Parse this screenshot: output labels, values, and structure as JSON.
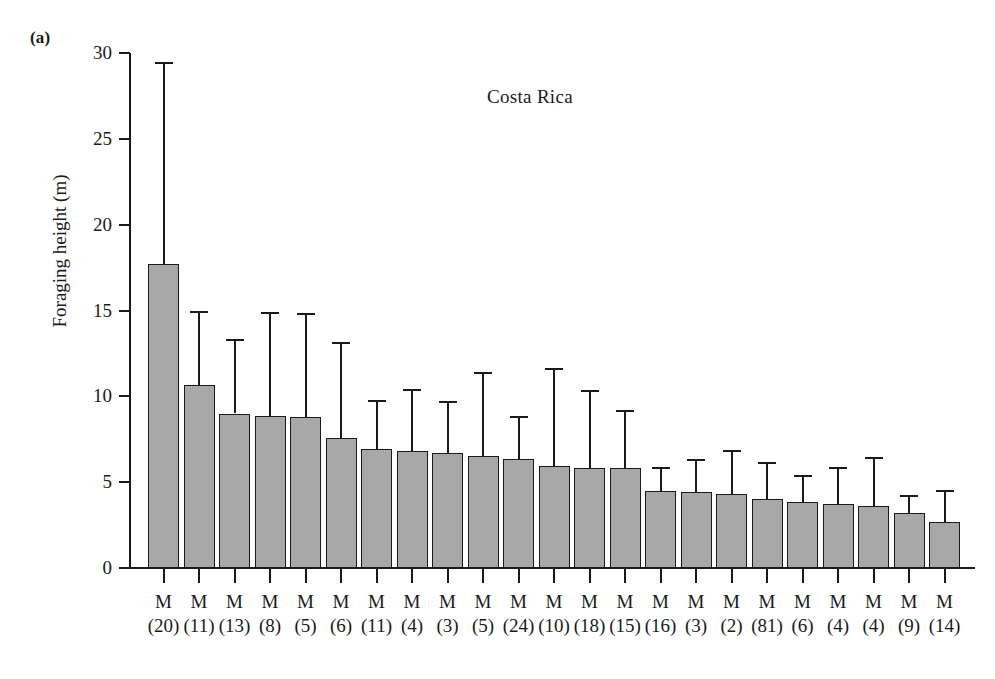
{
  "panel": {
    "label": "(a)"
  },
  "axes": {
    "ylabel": "Foraging height (m)",
    "yticks": [
      "0",
      "5",
      "10",
      "15",
      "20",
      "25",
      "30"
    ],
    "ytick_values": [
      0,
      5,
      10,
      15,
      20,
      25,
      30
    ]
  },
  "chart_data": {
    "type": "bar",
    "title": "Costa Rica",
    "xlabel": "",
    "ylabel": "Foraging height (m)",
    "ylim": [
      0,
      30
    ],
    "grid": false,
    "legend": null,
    "error_bars": "upper only (mean + SD)",
    "categories": [
      "M (20)",
      "M (11)",
      "M (13)",
      "M (8)",
      "M (5)",
      "M (6)",
      "M (11)",
      "M (4)",
      "M (3)",
      "M (5)",
      "M (24)",
      "M (10)",
      "M (18)",
      "M (15)",
      "M (16)",
      "M (3)",
      "M (2)",
      "M (81)",
      "M (6)",
      "M (4)",
      "M (4)",
      "M (9)",
      "M (14)"
    ],
    "sex_labels": [
      "M",
      "M",
      "M",
      "M",
      "M",
      "M",
      "M",
      "M",
      "M",
      "M",
      "M",
      "M",
      "M",
      "M",
      "M",
      "M",
      "M",
      "M",
      "M",
      "M",
      "M",
      "M",
      "M"
    ],
    "sample_sizes": [
      "(20)",
      "(11)",
      "(13)",
      "(8)",
      "(5)",
      "(6)",
      "(11)",
      "(4)",
      "(3)",
      "(5)",
      "(24)",
      "(10)",
      "(18)",
      "(15)",
      "(16)",
      "(3)",
      "(2)",
      "(81)",
      "(6)",
      "(4)",
      "(4)",
      "(9)",
      "(14)"
    ],
    "sample_size_values": [
      20,
      11,
      13,
      8,
      5,
      6,
      11,
      4,
      3,
      5,
      24,
      10,
      18,
      15,
      16,
      3,
      2,
      81,
      6,
      4,
      4,
      9,
      14
    ],
    "values": [
      17.7,
      10.65,
      9.0,
      8.85,
      8.8,
      7.6,
      6.95,
      6.8,
      6.7,
      6.55,
      6.35,
      5.95,
      5.85,
      5.8,
      4.5,
      4.45,
      4.3,
      4.0,
      3.85,
      3.75,
      3.6,
      3.2,
      2.7
    ],
    "error_upper": [
      29.5,
      15.0,
      13.35,
      14.9,
      14.85,
      13.15,
      9.8,
      10.45,
      9.75,
      11.4,
      8.85,
      11.65,
      10.35,
      9.2,
      5.9,
      6.35,
      6.9,
      6.2,
      5.4,
      5.9,
      6.45,
      4.25,
      4.55
    ]
  },
  "colors": {
    "bar_fill": "#a8a8a8",
    "bar_stroke": "#1a1a1a",
    "background": "#ffffff",
    "text": "#1a1a1a"
  }
}
